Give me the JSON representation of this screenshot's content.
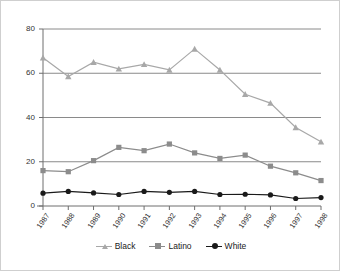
{
  "chart_data": {
    "type": "line",
    "title": "",
    "xlabel": "",
    "ylabel": "",
    "categories": [
      "1987",
      "1988",
      "1989",
      "1990",
      "1991",
      "1992",
      "1993",
      "1994",
      "1995",
      "1996",
      "1997",
      "1998"
    ],
    "ylim": [
      0,
      80
    ],
    "yticks": [
      0,
      20,
      40,
      60,
      80
    ],
    "grid": true,
    "legend_position": "bottom",
    "series": [
      {
        "name": "Black",
        "color": "#a8a8a8",
        "marker": "triangle",
        "values": [
          67,
          58.5,
          65,
          62,
          64,
          61.5,
          71,
          61.5,
          50.5,
          46.5,
          35.5,
          29
        ]
      },
      {
        "name": "Latino",
        "color": "#8c8c8c",
        "marker": "square",
        "values": [
          16,
          15.5,
          20.5,
          26.5,
          25,
          28,
          24,
          21.5,
          23,
          18,
          15,
          11.5
        ]
      },
      {
        "name": "White",
        "color": "#1a1a1a",
        "marker": "circle",
        "values": [
          5.8,
          6.6,
          5.9,
          5.2,
          6.6,
          6.2,
          6.6,
          5.2,
          5.3,
          5.0,
          3.4,
          3.8
        ]
      }
    ]
  },
  "axes": {
    "y_tick_labels": [
      "80",
      "60",
      "40",
      "20",
      "0"
    ],
    "x_tick_labels": [
      "1987",
      "1988",
      "1989",
      "1990",
      "1991",
      "1992",
      "1993",
      "1994",
      "1995",
      "1996",
      "1997",
      "1998"
    ]
  },
  "legend": {
    "items": [
      {
        "label": "Black",
        "color": "#a8a8a8",
        "marker": "triangle"
      },
      {
        "label": "Latino",
        "color": "#8c8c8c",
        "marker": "square"
      },
      {
        "label": "White",
        "color": "#1a1a1a",
        "marker": "circle"
      }
    ]
  },
  "colors": {
    "grid": "#8a8a8a",
    "axis": "#6e6e6e",
    "background": "#ffffff",
    "frame": "#cfcfcf",
    "text": "#333333"
  }
}
